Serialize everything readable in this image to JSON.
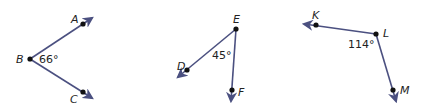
{
  "angles": [
    {
      "name": "angle-ABC",
      "vertex": {
        "label": "B",
        "x": 30,
        "y": 59
      },
      "measure": "66°",
      "points": [
        {
          "label": "A",
          "x": 83,
          "y": 24,
          "tip": [
            92,
            18
          ],
          "lx": 71,
          "ly": 23
        },
        {
          "label": "C",
          "x": 83,
          "y": 92,
          "tip": [
            92,
            98
          ],
          "lx": 70,
          "ly": 103
        }
      ],
      "vertex_label_pos": [
        16,
        63
      ],
      "measure_pos": [
        39,
        63
      ]
    },
    {
      "name": "angle-DEF",
      "vertex": {
        "label": "E",
        "x": 236,
        "y": 29
      },
      "measure": "45°",
      "points": [
        {
          "label": "D",
          "x": 187,
          "y": 70,
          "tip": [
            178,
            77
          ],
          "lx": 177,
          "ly": 70
        },
        {
          "label": "F",
          "x": 232,
          "y": 90,
          "tip": [
            231,
            101
          ],
          "lx": 238,
          "ly": 96
        }
      ],
      "vertex_label_pos": [
        233,
        23
      ],
      "measure_pos": [
        212,
        59
      ]
    },
    {
      "name": "angle-KLM",
      "vertex": {
        "label": "L",
        "x": 376,
        "y": 34
      },
      "measure": "114°",
      "points": [
        {
          "label": "K",
          "x": 316,
          "y": 25,
          "tip": [
            304,
            24
          ],
          "lx": 312,
          "ly": 19
        },
        {
          "label": "M",
          "x": 393,
          "y": 90,
          "tip": [
            396,
            101
          ],
          "lx": 400,
          "ly": 94
        }
      ],
      "vertex_label_pos": [
        383,
        37
      ],
      "measure_pos": [
        348,
        48
      ]
    }
  ],
  "colors": {
    "ray": "#4b5080",
    "point": "#111111",
    "text": "#222222"
  }
}
